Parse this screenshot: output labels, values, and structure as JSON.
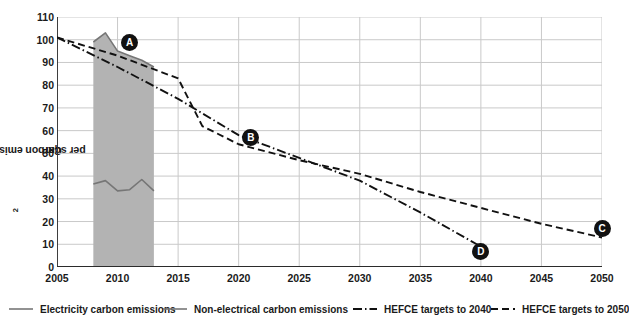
{
  "chart_data": {
    "type": "area",
    "title": "",
    "xlabel": "",
    "ylabel": "Carbon emissions kg CO2 per sqm",
    "ylabel_prefix": "Carbon emissions kg CO",
    "ylabel_sub": "2",
    "ylabel_suffix": " per sqm",
    "xlim": [
      2005,
      2050
    ],
    "ylim": [
      0,
      110
    ],
    "ytick_step": 10,
    "xtick_step": 5,
    "grid": true,
    "legend_position": "bottom",
    "yticks": [
      0,
      10,
      20,
      30,
      40,
      50,
      60,
      70,
      80,
      90,
      100,
      110
    ],
    "xticks": [
      2005,
      2010,
      2015,
      2020,
      2025,
      2030,
      2035,
      2040,
      2045,
      2050
    ],
    "shaded_band": {
      "label": "actual data period",
      "x_start": 2008,
      "x_end": 2013,
      "color": "#b3b3b3"
    },
    "series": [
      {
        "name": "Electricity carbon emissions",
        "style": "solid",
        "color": "#767676",
        "x": [
          2008,
          2009,
          2010,
          2011,
          2012,
          2013
        ],
        "values": [
          36.5,
          38.0,
          33.5,
          34.0,
          38.5,
          33.5
        ]
      },
      {
        "name": "Non-electrical carbon emissions",
        "style": "solid",
        "color": "#767676",
        "note": "upper edge of shaded area = total emissions",
        "x": [
          2008,
          2009,
          2010,
          2011,
          2012,
          2013
        ],
        "values": [
          99.0,
          103.0,
          95.0,
          93.0,
          91.0,
          88.0
        ]
      },
      {
        "name": "HEFCE targets to 2040",
        "style": "dashdot",
        "color": "#111111",
        "x": [
          2005,
          2010,
          2015,
          2020,
          2025,
          2030,
          2035,
          2040
        ],
        "values": [
          101,
          88,
          74,
          58,
          48,
          38,
          24,
          9
        ]
      },
      {
        "name": "HEFCE targets to 2050",
        "style": "dashed",
        "color": "#111111",
        "x": [
          2005,
          2010,
          2015,
          2017,
          2020,
          2025,
          2030,
          2035,
          2040,
          2045,
          2050
        ],
        "values": [
          101,
          93,
          83,
          62,
          54,
          47,
          41,
          33,
          26,
          19,
          13
        ]
      }
    ],
    "annotations": [
      {
        "label": "A",
        "x": 2011,
        "y": 99
      },
      {
        "label": "B",
        "x": 2021,
        "y": 57
      },
      {
        "label": "C",
        "x": 2050,
        "y": 17
      },
      {
        "label": "D",
        "x": 2040,
        "y": 7
      }
    ],
    "legend": [
      {
        "label": "Electricity carbon emissions",
        "style": "solid",
        "color": "#767676"
      },
      {
        "label": "Non-electrical  carbon emissions",
        "style": "solid",
        "color": "#767676"
      },
      {
        "label": "HEFCE targets to 2040",
        "style": "dashdot",
        "color": "#111111"
      },
      {
        "label": "HEFCE targets to 2050",
        "style": "dashed",
        "color": "#111111"
      }
    ]
  }
}
